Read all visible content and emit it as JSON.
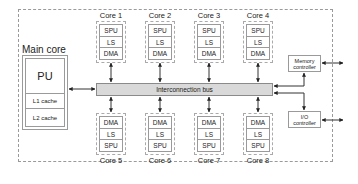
{
  "main_core": {
    "label": "Main core",
    "pu": "PU",
    "l1": "L1 cache",
    "l2": "L2 cache"
  },
  "bus": {
    "label": "Interconnection bus"
  },
  "cores_top": [
    {
      "label": "Core 1",
      "units": [
        "SPU",
        "LS",
        "DMA"
      ]
    },
    {
      "label": "Core 2",
      "units": [
        "SPU",
        "LS",
        "DMA"
      ]
    },
    {
      "label": "Core 3",
      "units": [
        "SPU",
        "LS",
        "DMA"
      ]
    },
    {
      "label": "Core 4",
      "units": [
        "SPU",
        "LS",
        "DMA"
      ]
    }
  ],
  "cores_bottom": [
    {
      "label": "Core 5",
      "units": [
        "DMA",
        "LS",
        "SPU"
      ]
    },
    {
      "label": "Core 6",
      "units": [
        "DMA",
        "LS",
        "SPU"
      ]
    },
    {
      "label": "Core 7",
      "units": [
        "DMA",
        "LS",
        "SPU"
      ]
    },
    {
      "label": "Core 8",
      "units": [
        "DMA",
        "LS",
        "SPU"
      ]
    }
  ],
  "memory_controller": {
    "line1": "Memory",
    "line2": "controller"
  },
  "io_controller": {
    "line1": "I/O",
    "line2": "controller"
  }
}
